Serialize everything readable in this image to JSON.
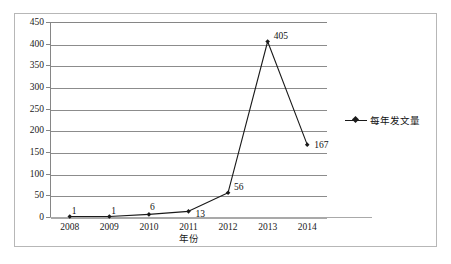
{
  "chart_data": {
    "type": "line",
    "title": "",
    "xlabel": "年份",
    "ylabel": "",
    "categories": [
      "2008",
      "2009",
      "2010",
      "2011",
      "2012",
      "2013",
      "2014"
    ],
    "values": [
      1,
      1,
      6,
      13,
      56,
      405,
      167
    ],
    "point_labels": [
      "1",
      "1",
      "6",
      "13",
      "56",
      "405",
      "167"
    ],
    "ylim": [
      0,
      450
    ],
    "ytick_step": 50,
    "yticks": [
      "450",
      "400",
      "350",
      "300",
      "250",
      "200",
      "150",
      "100",
      "50",
      "0"
    ],
    "grid": true,
    "grid_axis": "y",
    "legend": {
      "position": "right",
      "entries": [
        {
          "name": "每年发文量",
          "marker": "diamond",
          "color": "#1a1a1a"
        }
      ]
    },
    "series": [
      {
        "name": "每年发文量",
        "values": [
          1,
          1,
          6,
          13,
          56,
          405,
          167
        ],
        "color": "#1a1a1a",
        "marker": "diamond"
      }
    ]
  },
  "colors": {
    "line": "#1a1a1a",
    "marker": "#1a1a1a",
    "gridline": "#8c8c8c",
    "axis": "#868686",
    "frame": "#b7b7b7",
    "background": "#ffffff",
    "text": "#1a1a1a"
  }
}
